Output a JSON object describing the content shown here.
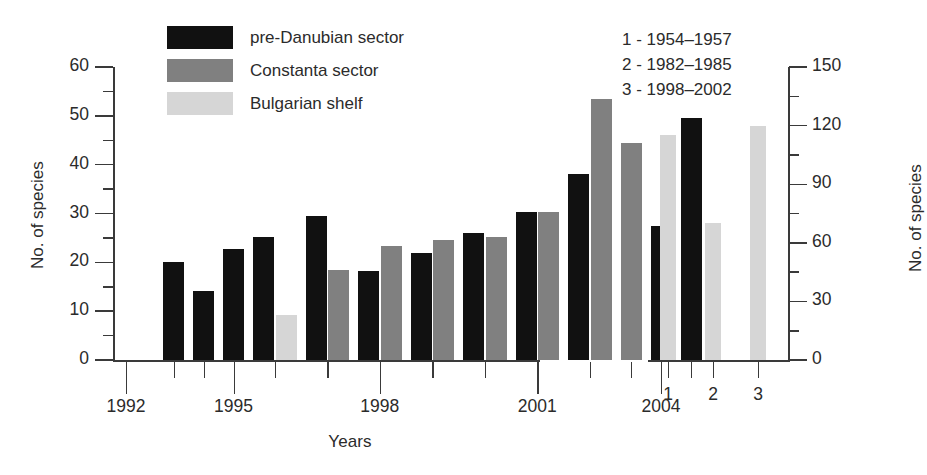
{
  "figure": {
    "background": "#ffffff",
    "width": 927,
    "height": 475
  },
  "legend": {
    "items": [
      {
        "label": "pre-Danubian sector",
        "color": "#111111",
        "key": "pre_danubian"
      },
      {
        "label": "Constanta sector",
        "color": "#808080",
        "key": "constanta"
      },
      {
        "label": "Bulgarian shelf",
        "color": "#d6d6d6",
        "key": "bulgarian"
      }
    ]
  },
  "period_notes": [
    "1 - 1954–1957",
    "2 - 1982–1985",
    "3 - 1998–2002"
  ],
  "chart_data": [
    {
      "id": "main-timeseries",
      "type": "bar",
      "title": "",
      "xlabel": "Years",
      "ylabel": "No. of species",
      "ylim": [
        0,
        60
      ],
      "ytick_major": [
        0,
        10,
        20,
        30,
        40,
        50,
        60
      ],
      "ytick_minor": [
        5,
        15,
        25,
        35,
        45,
        55
      ],
      "xlim": [
        1992,
        2005.6
      ],
      "xtick_major": [
        1992,
        1995,
        1998,
        2001,
        2004
      ],
      "xtick_major_labels": [
        "1992",
        "1995",
        "1998",
        "2001",
        "2004"
      ],
      "xtick_minor": [
        1993,
        1994,
        1996,
        1997,
        1999,
        2000,
        2002,
        2003,
        2005
      ],
      "grid": false,
      "legend_position": "top-left-inside",
      "categories": [
        1993,
        1994,
        1995,
        1996,
        1997,
        1998,
        1999,
        2000,
        2001,
        2002,
        2003,
        2004,
        2005
      ],
      "series": [
        {
          "name": "pre-Danubian sector",
          "color": "#111111",
          "values": [
            20.0,
            14.1,
            22.7,
            25.2,
            29.4,
            18.2,
            22.0,
            26.1,
            30.4,
            38.1,
            null,
            27.4,
            49.5
          ]
        },
        {
          "name": "Constanta sector",
          "color": "#808080",
          "values": [
            null,
            null,
            null,
            null,
            18.4,
            23.3,
            24.5,
            25.2,
            30.4,
            53.4,
            44.5,
            null,
            null
          ]
        },
        {
          "name": "Bulgarian shelf",
          "color": "#d6d6d6",
          "values": [
            null,
            null,
            null,
            9.3,
            null,
            null,
            null,
            null,
            null,
            null,
            null,
            null,
            null
          ]
        }
      ]
    },
    {
      "id": "inset-periods",
      "type": "bar",
      "title": "",
      "xlabel": "",
      "ylabel": "No. of species",
      "ylim": [
        0,
        150
      ],
      "ytick_major": [
        0,
        30,
        60,
        90,
        120,
        150
      ],
      "ytick_minor": [
        15,
        45,
        75,
        105,
        135
      ],
      "grid": false,
      "axis_side": "right",
      "categories": [
        "1",
        "2",
        "3"
      ],
      "values": [
        115,
        70,
        120
      ],
      "color": "#d6d6d6"
    }
  ]
}
